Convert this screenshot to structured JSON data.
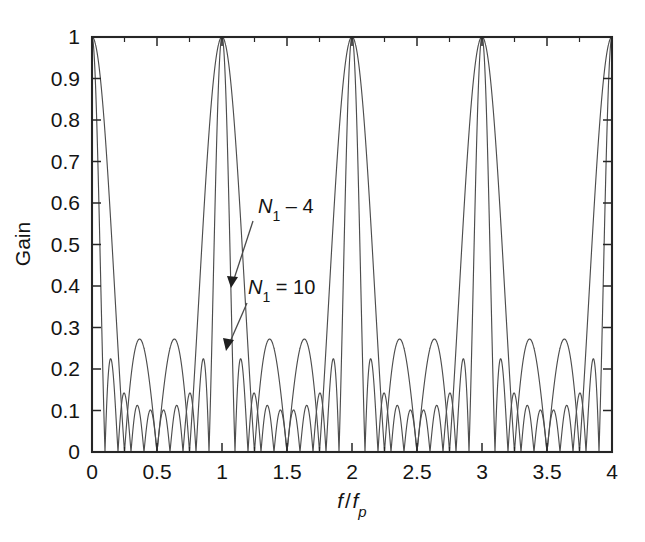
{
  "figure": {
    "title": "",
    "background_color": "#ffffff",
    "axis_color": "#262626",
    "curve_color": "#4d4d4d"
  },
  "axes": {
    "y_title": "Gain",
    "x_title_parts": {
      "numerator": "f",
      "slash": "/",
      "denominator": "f",
      "denominator_sub": "p"
    },
    "x_ticklabels": [
      "0",
      "0.5",
      "1",
      "1.5",
      "2",
      "2.5",
      "3",
      "3.5",
      "4"
    ],
    "y_ticklabels": [
      "0",
      "0.1",
      "0.2",
      "0.3",
      "0.4",
      "0.5",
      "0.6",
      "0.7",
      "0.8",
      "0.9",
      "1"
    ]
  },
  "annotations": [
    {
      "label_prefix": "N",
      "label_sub": "1",
      "label_suffix": " – 4",
      "name": "n1-4-label"
    },
    {
      "label_prefix": "N",
      "label_sub": "1",
      "label_suffix": " = 10",
      "name": "n1-10-label"
    }
  ],
  "chart_data": {
    "type": "line",
    "title": "",
    "xlabel": "f/f_p",
    "ylabel": "Gain",
    "xlim": [
      0,
      4
    ],
    "ylim": [
      0,
      1
    ],
    "xticks": [
      0,
      0.5,
      1,
      1.5,
      2,
      2.5,
      3,
      3.5,
      4
    ],
    "yticks": [
      0,
      0.1,
      0.2,
      0.3,
      0.4,
      0.5,
      0.6,
      0.7,
      0.8,
      0.9,
      1.0
    ],
    "x_minor_tick_step": 0.25,
    "grid": false,
    "legend": "annotated-inline",
    "formula": "gain(x) = |sin(N*pi*x) / (N*sin(pi*x))|",
    "series": [
      {
        "name": "N1 = 4",
        "N": 4,
        "peak_value": 1.0,
        "peak_positions": [
          0,
          1,
          2,
          3,
          4
        ],
        "minimum_value": 0.145,
        "minimum_positions": [
          0.5,
          1.5,
          2.5,
          3.5
        ]
      },
      {
        "name": "N1 = 10",
        "N": 10,
        "peak_value": 1.0,
        "peak_positions": [
          0,
          1,
          2,
          3,
          4
        ],
        "minimum_value": 0.05,
        "minimum_positions": [
          0.5,
          1.5,
          2.5,
          3.5
        ]
      }
    ]
  }
}
